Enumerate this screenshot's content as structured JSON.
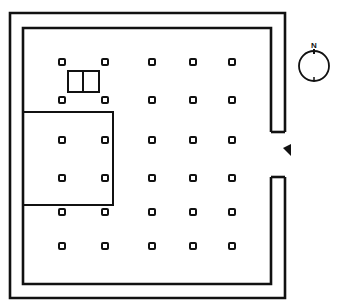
{
  "diagram": {
    "type": "floor-plan",
    "colors": {
      "ink": "#111111",
      "background": "#ffffff"
    },
    "compass": {
      "label": "N",
      "icon": "north-compass-icon"
    },
    "entrance": {
      "icon": "entrance-arrow-icon",
      "side": "east"
    },
    "column_grid": {
      "columns": 5,
      "rows": 6,
      "column_count": 30
    },
    "features": [
      "outer-wall",
      "inner-wall",
      "east-entrance-opening",
      "west-annex-room",
      "double-altar-box"
    ]
  }
}
